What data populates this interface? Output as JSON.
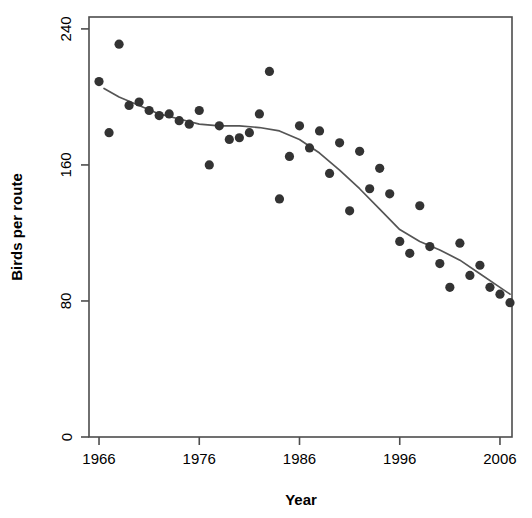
{
  "chart_data": {
    "type": "scatter",
    "title": "",
    "xlabel": "Year",
    "ylabel": "Birds per route",
    "xlim": [
      1965.0,
      2007.2
    ],
    "ylim": [
      0,
      247
    ],
    "grid": false,
    "legend": null,
    "xticks": [
      1966,
      1976,
      1986,
      1996,
      2006
    ],
    "yticks": [
      0,
      80,
      160,
      240
    ],
    "point_color": "#333333",
    "line_color": "#555555",
    "series": [
      {
        "name": "Birds per route",
        "type": "scatter",
        "x": [
          1966,
          1967,
          1968,
          1969,
          1970,
          1971,
          1972,
          1973,
          1974,
          1975,
          1976,
          1977,
          1978,
          1979,
          1980,
          1981,
          1982,
          1983,
          1984,
          1985,
          1986,
          1987,
          1988,
          1989,
          1990,
          1991,
          1992,
          1993,
          1994,
          1995,
          1996,
          1997,
          1998,
          1999,
          2000,
          2001,
          2002,
          2003,
          2004,
          2005,
          2006,
          2007
        ],
        "y": [
          209,
          179,
          231,
          195,
          197,
          192,
          189,
          190,
          186,
          184,
          192,
          160,
          183,
          175,
          176,
          179,
          190,
          215,
          140,
          165,
          183,
          170,
          180,
          155,
          173,
          133,
          168,
          146,
          158,
          143,
          115,
          108,
          136,
          112,
          102,
          88,
          114,
          95,
          101,
          88,
          84,
          79
        ]
      },
      {
        "name": "LOESS smooth",
        "type": "line",
        "x": [
          1966.5,
          1968,
          1970,
          1972,
          1974,
          1976,
          1978,
          1980,
          1982,
          1984,
          1986,
          1988,
          1990,
          1992,
          1994,
          1996,
          1998,
          2000,
          2002,
          2004,
          2006,
          2007
        ],
        "y": [
          205,
          200,
          195,
          190,
          187,
          184,
          183,
          183,
          182,
          180,
          175,
          167,
          157,
          146,
          134,
          122,
          115,
          110,
          104,
          96,
          88,
          84
        ]
      }
    ]
  },
  "axis": {
    "xlabel": "Year",
    "ylabel": "Birds per route",
    "xtick_labels": [
      "1966",
      "1976",
      "1986",
      "1996",
      "2006"
    ],
    "ytick_labels": [
      "0",
      "80",
      "160",
      "240"
    ]
  }
}
